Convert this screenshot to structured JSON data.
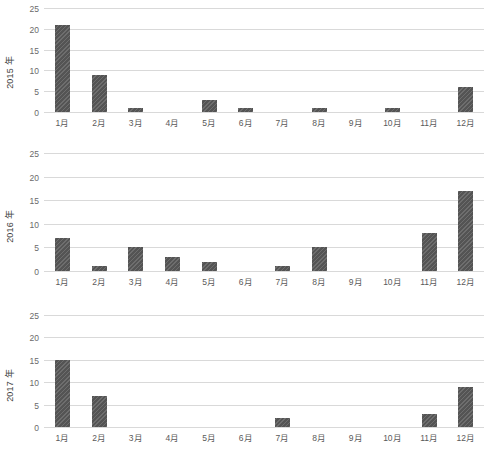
{
  "chart_data": [
    {
      "type": "bar",
      "title": "",
      "xlabel": "",
      "ylabel": "2015 年",
      "categories": [
        "1月",
        "2月",
        "3月",
        "4月",
        "5月",
        "6月",
        "7月",
        "8月",
        "9月",
        "10月",
        "11月",
        "12月"
      ],
      "values": [
        21,
        9,
        1,
        0,
        3,
        1,
        0,
        1,
        0,
        1,
        0,
        6
      ],
      "ylim": [
        0,
        25
      ],
      "yticks": [
        0,
        5,
        10,
        15,
        20,
        25
      ],
      "ytick_labels": [
        "0",
        "5",
        "10",
        "15",
        "20",
        "25"
      ],
      "grid": true,
      "legend": "none",
      "bar_color": "#595959"
    },
    {
      "type": "bar",
      "title": "",
      "xlabel": "",
      "ylabel": "2016 年",
      "categories": [
        "1月",
        "2月",
        "3月",
        "4月",
        "5月",
        "6月",
        "7月",
        "8月",
        "9月",
        "10月",
        "11月",
        "12月"
      ],
      "values": [
        7,
        1,
        5,
        3,
        2,
        0,
        1,
        5,
        0,
        0,
        8,
        17
      ],
      "ylim": [
        0,
        25
      ],
      "yticks": [
        0,
        5,
        10,
        15,
        20,
        25
      ],
      "ytick_labels": [
        "0",
        "5",
        "10",
        "15",
        "20",
        "25"
      ],
      "grid": true,
      "legend": "none",
      "bar_color": "#595959"
    },
    {
      "type": "bar",
      "title": "",
      "xlabel": "",
      "ylabel": "2017 年",
      "categories": [
        "1月",
        "2月",
        "3月",
        "4月",
        "5月",
        "6月",
        "7月",
        "8月",
        "9月",
        "10月",
        "11月",
        "12月"
      ],
      "values": [
        15,
        7,
        0,
        0,
        0,
        0,
        2,
        0,
        0,
        0,
        3,
        9
      ],
      "ylim": [
        0,
        25
      ],
      "yticks": [
        0,
        5,
        10,
        15,
        20,
        25
      ],
      "ytick_labels": [
        "0",
        "5",
        "10",
        "15",
        "20",
        "25"
      ],
      "grid": true,
      "legend": "none",
      "bar_color": "#595959"
    }
  ]
}
